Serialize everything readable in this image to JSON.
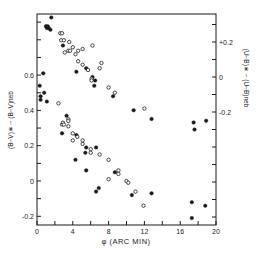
{
  "chart_data": {
    "type": "scatter",
    "title": "",
    "xlabel": "φ (ARC MIN)",
    "ylabel_left": "(B−V)∗ − (B−V)neb",
    "ylabel_right": "(U−B)∗ − (U−B)neb",
    "xlim": [
      0,
      20
    ],
    "ylim_left": [
      -0.25,
      0.95
    ],
    "ylim_right": [
      -0.85,
      0.35
    ],
    "x_ticks": [
      0,
      4,
      8,
      12,
      16,
      20
    ],
    "x_tick_labels": [
      "0",
      "4",
      "8",
      "12",
      "16",
      "20"
    ],
    "x_minor_step": 2,
    "y_left_ticks": [
      -0.2,
      0,
      0.2,
      0.4,
      0.6
    ],
    "y_left_tick_labels": [
      "-0.2",
      "0",
      "0.2",
      "0.4",
      "0.6"
    ],
    "y_left_minor_step": 0.1,
    "y_right_ticks": [
      -0.2,
      0,
      0.2
    ],
    "y_right_tick_labels": [
      "-0.2",
      "0",
      "+0.2"
    ],
    "y_right_minor_step": 0.1,
    "grid": false,
    "legend": null,
    "marker_key": {
      "filled": "filled circle",
      "open": "open circle"
    },
    "series": [
      {
        "name": "(U−B)∗ − (U−B)neb",
        "axis": "right",
        "points": [
          {
            "x": 1.6,
            "y": 0.34,
            "m": "filled"
          },
          {
            "x": 1.0,
            "y": 0.29,
            "m": "filled"
          },
          {
            "x": 1.1,
            "y": 0.28,
            "m": "filled"
          },
          {
            "x": 1.2,
            "y": 0.29,
            "m": "filled"
          },
          {
            "x": 1.3,
            "y": 0.28,
            "m": "filled"
          },
          {
            "x": 1.5,
            "y": 0.27,
            "m": "filled"
          },
          {
            "x": 2.6,
            "y": 0.25,
            "m": "open"
          },
          {
            "x": 2.8,
            "y": 0.25,
            "m": "open"
          },
          {
            "x": 2.7,
            "y": 0.21,
            "m": "open"
          },
          {
            "x": 3.0,
            "y": 0.21,
            "m": "open"
          },
          {
            "x": 2.9,
            "y": 0.18,
            "m": "filled"
          },
          {
            "x": 3.6,
            "y": 0.2,
            "m": "open"
          },
          {
            "x": 3.1,
            "y": 0.14,
            "m": "open"
          },
          {
            "x": 3.5,
            "y": 0.15,
            "m": "open"
          },
          {
            "x": 3.7,
            "y": 0.15,
            "m": "open"
          },
          {
            "x": 4.0,
            "y": 0.17,
            "m": "open"
          },
          {
            "x": 4.3,
            "y": 0.13,
            "m": "open"
          },
          {
            "x": 4.6,
            "y": 0.15,
            "m": "open"
          },
          {
            "x": 5.1,
            "y": 0.16,
            "m": "open"
          },
          {
            "x": 6.2,
            "y": 0.18,
            "m": "open"
          },
          {
            "x": 4.6,
            "y": 0.09,
            "m": "open"
          },
          {
            "x": 5.1,
            "y": 0.07,
            "m": "open"
          },
          {
            "x": 4.4,
            "y": 0.03,
            "m": "filled"
          },
          {
            "x": 5.5,
            "y": 0.05,
            "m": "filled"
          },
          {
            "x": 5.7,
            "y": 0.04,
            "m": "open"
          },
          {
            "x": 7.2,
            "y": 0.08,
            "m": "open"
          },
          {
            "x": 7.0,
            "y": 0.05,
            "m": "open"
          },
          {
            "x": 6.2,
            "y": 0.0,
            "m": "filled"
          },
          {
            "x": 6.1,
            "y": -0.01,
            "m": "open"
          },
          {
            "x": 6.1,
            "y": -0.02,
            "m": "open"
          },
          {
            "x": 6.5,
            "y": -0.02,
            "m": "filled"
          },
          {
            "x": 6.4,
            "y": -0.05,
            "m": "filled"
          },
          {
            "x": 8.0,
            "y": -0.06,
            "m": "open"
          },
          {
            "x": 8.7,
            "y": -0.09,
            "m": "open"
          },
          {
            "x": 8.5,
            "y": -0.11,
            "m": "filled"
          },
          {
            "x": 10.8,
            "y": -0.19,
            "m": "filled"
          },
          {
            "x": 12.0,
            "y": -0.18,
            "m": "open"
          },
          {
            "x": 12.8,
            "y": -0.24,
            "m": "filled"
          },
          {
            "x": 17.5,
            "y": -0.26,
            "m": "filled"
          },
          {
            "x": 17.6,
            "y": -0.3,
            "m": "filled"
          },
          {
            "x": 18.9,
            "y": -0.25,
            "m": "filled"
          }
        ]
      },
      {
        "name": "(B−V)∗ − (B−V)neb",
        "axis": "left",
        "points": [
          {
            "x": 0.7,
            "y": 0.61,
            "m": "filled"
          },
          {
            "x": 0.3,
            "y": 0.54,
            "m": "filled"
          },
          {
            "x": 0.4,
            "y": 0.48,
            "m": "filled"
          },
          {
            "x": 0.4,
            "y": 0.46,
            "m": "filled"
          },
          {
            "x": 0.8,
            "y": 0.5,
            "m": "filled"
          },
          {
            "x": 1.1,
            "y": 0.45,
            "m": "filled"
          },
          {
            "x": 2.4,
            "y": 0.44,
            "m": "open"
          },
          {
            "x": 3.3,
            "y": 0.37,
            "m": "filled"
          },
          {
            "x": 3.5,
            "y": 0.35,
            "m": "open"
          },
          {
            "x": 3.5,
            "y": 0.34,
            "m": "open"
          },
          {
            "x": 2.8,
            "y": 0.32,
            "m": "open"
          },
          {
            "x": 2.9,
            "y": 0.33,
            "m": "open"
          },
          {
            "x": 3.0,
            "y": 0.32,
            "m": "open"
          },
          {
            "x": 3.5,
            "y": 0.31,
            "m": "open"
          },
          {
            "x": 2.8,
            "y": 0.27,
            "m": "filled"
          },
          {
            "x": 4.0,
            "y": 0.27,
            "m": "open"
          },
          {
            "x": 4.4,
            "y": 0.26,
            "m": "filled"
          },
          {
            "x": 4.5,
            "y": 0.25,
            "m": "open"
          },
          {
            "x": 4.0,
            "y": 0.23,
            "m": "open"
          },
          {
            "x": 5.1,
            "y": 0.23,
            "m": "open"
          },
          {
            "x": 5.1,
            "y": 0.21,
            "m": "open"
          },
          {
            "x": 5.5,
            "y": 0.19,
            "m": "filled"
          },
          {
            "x": 6.0,
            "y": 0.18,
            "m": "open"
          },
          {
            "x": 6.0,
            "y": 0.16,
            "m": "open"
          },
          {
            "x": 5.4,
            "y": 0.16,
            "m": "filled"
          },
          {
            "x": 6.6,
            "y": 0.19,
            "m": "filled"
          },
          {
            "x": 7.0,
            "y": 0.15,
            "m": "open"
          },
          {
            "x": 4.3,
            "y": 0.12,
            "m": "filled"
          },
          {
            "x": 8.0,
            "y": 0.12,
            "m": "open"
          },
          {
            "x": 5.5,
            "y": 0.06,
            "m": "filled"
          },
          {
            "x": 8.7,
            "y": 0.05,
            "m": "filled"
          },
          {
            "x": 9.1,
            "y": 0.06,
            "m": "open"
          },
          {
            "x": 9.1,
            "y": 0.04,
            "m": "open"
          },
          {
            "x": 8.0,
            "y": 0.01,
            "m": "open"
          },
          {
            "x": 6.9,
            "y": -0.04,
            "m": "filled"
          },
          {
            "x": 6.6,
            "y": -0.06,
            "m": "filled"
          },
          {
            "x": 10.0,
            "y": 0.0,
            "m": "open"
          },
          {
            "x": 10.2,
            "y": -0.01,
            "m": "open"
          },
          {
            "x": 10.6,
            "y": -0.08,
            "m": "filled"
          },
          {
            "x": 11.0,
            "y": -0.06,
            "m": "open"
          },
          {
            "x": 11.9,
            "y": -0.14,
            "m": "open"
          },
          {
            "x": 12.8,
            "y": -0.07,
            "m": "filled"
          },
          {
            "x": 17.3,
            "y": -0.12,
            "m": "filled"
          },
          {
            "x": 18.8,
            "y": -0.14,
            "m": "filled"
          },
          {
            "x": 17.3,
            "y": -0.21,
            "m": "filled"
          }
        ]
      }
    ]
  },
  "labels": {
    "xlabel": "φ (ARC MIN)",
    "ylabel_left": "(B−V)∗ − (B−V)neb",
    "ylabel_right": "(U−B)∗ − (U−B)neb"
  },
  "colors": {
    "ink": "#1a1a1a",
    "background": "#ffffff"
  }
}
